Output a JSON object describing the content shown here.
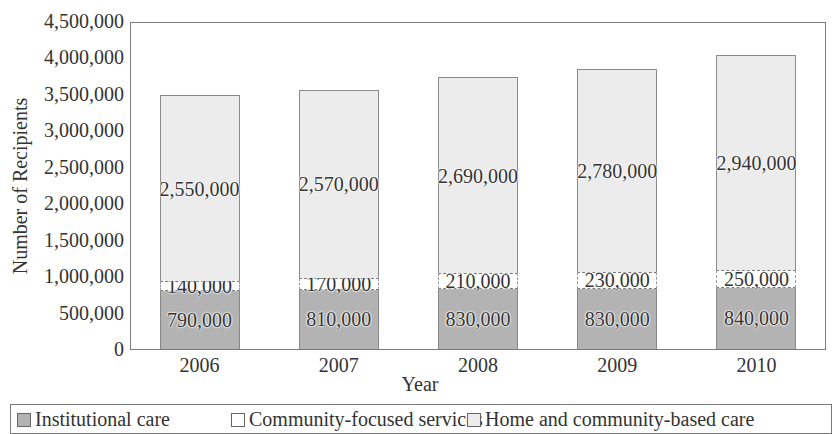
{
  "chart_data": {
    "type": "bar",
    "stacked": true,
    "title": "",
    "xlabel": "Year",
    "ylabel": "Number of Recipients",
    "ylim": [
      0,
      4500000
    ],
    "yticks": [
      "0",
      "500,000",
      "1,000,000",
      "1,500,000",
      "2,000,000",
      "2,500,000",
      "3,000,000",
      "3,500,000",
      "4,000,000",
      "4,500,000"
    ],
    "grid": false,
    "legend_position": "bottom",
    "categories": [
      "2006",
      "2007",
      "2008",
      "2009",
      "2010"
    ],
    "series": [
      {
        "name": "Institutional care",
        "color": "#b3b3b3",
        "values": [
          790000,
          810000,
          830000,
          830000,
          840000
        ],
        "labels": [
          "790,000",
          "810,000",
          "830,000",
          "830,000",
          "840,000"
        ]
      },
      {
        "name": "Community-focused services",
        "color": "#ffffff",
        "values": [
          140000,
          170000,
          210000,
          230000,
          250000
        ],
        "labels": [
          "140,000",
          "170,000",
          "210,000",
          "230,000",
          "250,000"
        ]
      },
      {
        "name": "Home and community-based care",
        "color": "#ececec",
        "values": [
          2550000,
          2570000,
          2690000,
          2780000,
          2940000
        ],
        "labels": [
          "2,550,000",
          "2,570,000",
          "2,690,000",
          "2,780,000",
          "2,940,000"
        ]
      }
    ]
  }
}
